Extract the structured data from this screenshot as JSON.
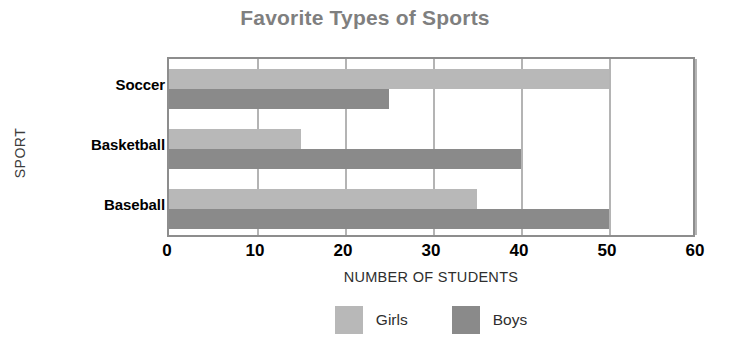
{
  "chart_data": {
    "type": "bar",
    "orientation": "horizontal",
    "title": "Favorite Types of Sports",
    "xlabel": "NUMBER OF STUDENTS",
    "ylabel": "SPORT",
    "categories": [
      "Soccer",
      "Basketball",
      "Baseball"
    ],
    "series": [
      {
        "name": "Girls",
        "values": [
          50,
          15,
          35
        ],
        "color": "#b8b8b8"
      },
      {
        "name": "Boys",
        "values": [
          25,
          40,
          50
        ],
        "color": "#8a8a8a"
      }
    ],
    "xlim": [
      0,
      60
    ],
    "xticks": [
      0,
      10,
      20,
      30,
      40,
      50,
      60
    ],
    "xtick_labels": [
      "0",
      "10",
      "20",
      "30",
      "40",
      "50",
      "60"
    ],
    "grid": true,
    "grid_axis": "x",
    "legend_position": "bottom",
    "title_color": "#7f7f7f",
    "plot_border_color": "#8d8d8d",
    "gridline_color": "#b4b4b4"
  },
  "legend": {
    "items": [
      {
        "label": "Girls",
        "color": "#b8b8b8"
      },
      {
        "label": "Boys",
        "color": "#8a8a8a"
      }
    ]
  }
}
